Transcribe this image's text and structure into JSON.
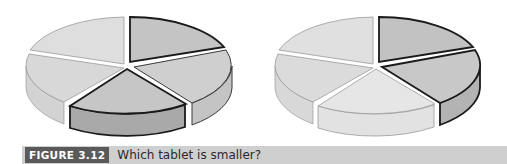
{
  "figure": {
    "label": "FIGURE 3.12",
    "caption": "Which tablet is smaller?"
  },
  "pies": [
    {
      "name": "left-tablet",
      "slices": [
        {
          "id": "top-right",
          "highlighted": true
        },
        {
          "id": "right",
          "highlighted": false
        },
        {
          "id": "bottom",
          "highlighted": true
        },
        {
          "id": "lower-left",
          "highlighted": false
        },
        {
          "id": "upper-left",
          "highlighted": false
        }
      ]
    },
    {
      "name": "right-tablet",
      "slices": [
        {
          "id": "top-right",
          "highlighted": true
        },
        {
          "id": "right",
          "highlighted": true
        },
        {
          "id": "bottom",
          "highlighted": false
        },
        {
          "id": "lower-left",
          "highlighted": false
        },
        {
          "id": "upper-left",
          "highlighted": false
        }
      ]
    }
  ],
  "colors": {
    "highlight_top": "#c4c4c4",
    "highlight_side": "#a9a9a9",
    "plain_top": "#dcdcdc",
    "plain_side": "#c8c8c8",
    "caption_bg": "#cfcfcf",
    "label_bg": "#5a5a5a"
  }
}
